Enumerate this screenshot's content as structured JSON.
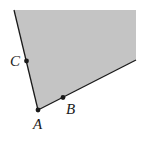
{
  "diagram": {
    "type": "angle-region",
    "colors": {
      "fill": "#c4c4c4",
      "stroke": "#1a1a1a",
      "background": "#ffffff"
    },
    "vertex": {
      "label": "A",
      "x": 38,
      "y": 110
    },
    "points": [
      {
        "label": "C",
        "x": 27,
        "y": 61,
        "on_ray": "AC"
      },
      {
        "label": "B",
        "x": 63,
        "y": 98,
        "on_ray": "AB"
      }
    ],
    "rays": [
      {
        "name": "AC",
        "from": [
          38,
          110
        ],
        "to": [
          14,
          10
        ]
      },
      {
        "name": "AB",
        "from": [
          38,
          110
        ],
        "to": [
          136,
          60
        ]
      }
    ],
    "labels": {
      "A": "A",
      "B": "B",
      "C": "C"
    }
  }
}
